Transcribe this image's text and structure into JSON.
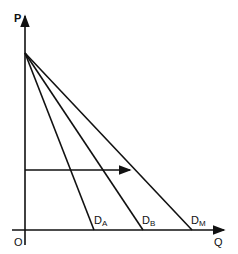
{
  "diagram": {
    "axes": {
      "y_label": "P",
      "x_label": "Q",
      "origin_label": "O"
    },
    "demand_curves": [
      {
        "id": "DA",
        "main": "D",
        "sub": "A",
        "x_intercept_px": 94
      },
      {
        "id": "DB",
        "main": "D",
        "sub": "B",
        "x_intercept_px": 143
      },
      {
        "id": "DM",
        "main": "D",
        "sub": "M",
        "x_intercept_px": 192
      }
    ],
    "apex_px": [
      25,
      53
    ],
    "horizontal_arrow": {
      "y_px": 170,
      "x_start_px": 25,
      "x_end_px": 130
    },
    "colors": {
      "line": "#111111",
      "background": "#ffffff"
    }
  }
}
